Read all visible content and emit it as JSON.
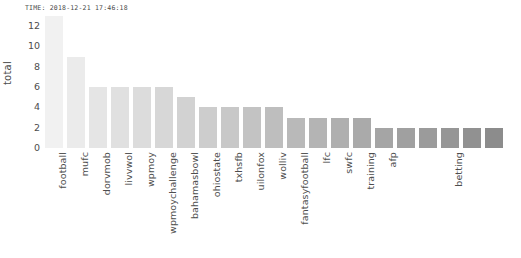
{
  "timestamp": "TIME: 2018-12-21 17:46:18",
  "chart_data": {
    "type": "bar",
    "title": "",
    "xlabel": "",
    "ylabel": "total",
    "ylim": [
      0,
      13
    ],
    "yticks": [
      0,
      2,
      4,
      6,
      8,
      10,
      12
    ],
    "grid": false,
    "legend": null,
    "categories": [
      "football",
      "mufc",
      "dorvmob",
      "livvwol",
      "wpmoy",
      "wpmoychallenge",
      "bahamasbowl",
      "ohiostate",
      "txhsfb",
      "uilonfox",
      "wolliv",
      "fantasyfootball",
      "lfc",
      "swfc",
      "training",
      "afp",
      "",
      "",
      "betting",
      "",
      ""
    ],
    "values": [
      13,
      9,
      6,
      6,
      6,
      6,
      5,
      4,
      4,
      4,
      4,
      3,
      3,
      3,
      3,
      2,
      2,
      2,
      2,
      2,
      2
    ],
    "bar_colors": [
      "#f1f1f1",
      "#ebebeb",
      "#e5e5e5",
      "#e0e0e0",
      "#dcdcdc",
      "#d7d7d7",
      "#d2d2d2",
      "#cdcdcd",
      "#c8c8c8",
      "#c3c3c3",
      "#bebebe",
      "#b9b9b9",
      "#b4b4b4",
      "#afafaf",
      "#aaaaaa",
      "#a5a5a5",
      "#a0a0a0",
      "#9b9b9b",
      "#969696",
      "#919191",
      "#8c8c8c"
    ]
  }
}
